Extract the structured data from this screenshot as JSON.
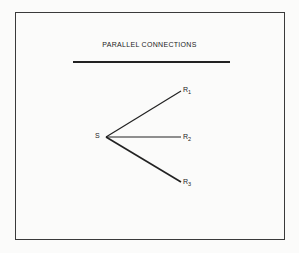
{
  "diagram": {
    "title": "PARALLEL CONNECTIONS",
    "source": {
      "label": "S"
    },
    "receivers": [
      {
        "label": "R",
        "subscript": "1"
      },
      {
        "label": "R",
        "subscript": "2"
      },
      {
        "label": "R",
        "subscript": "3"
      }
    ],
    "edges": [
      {
        "from": "S",
        "to": "R1"
      },
      {
        "from": "S",
        "to": "R2"
      },
      {
        "from": "S",
        "to": "R3"
      }
    ]
  }
}
